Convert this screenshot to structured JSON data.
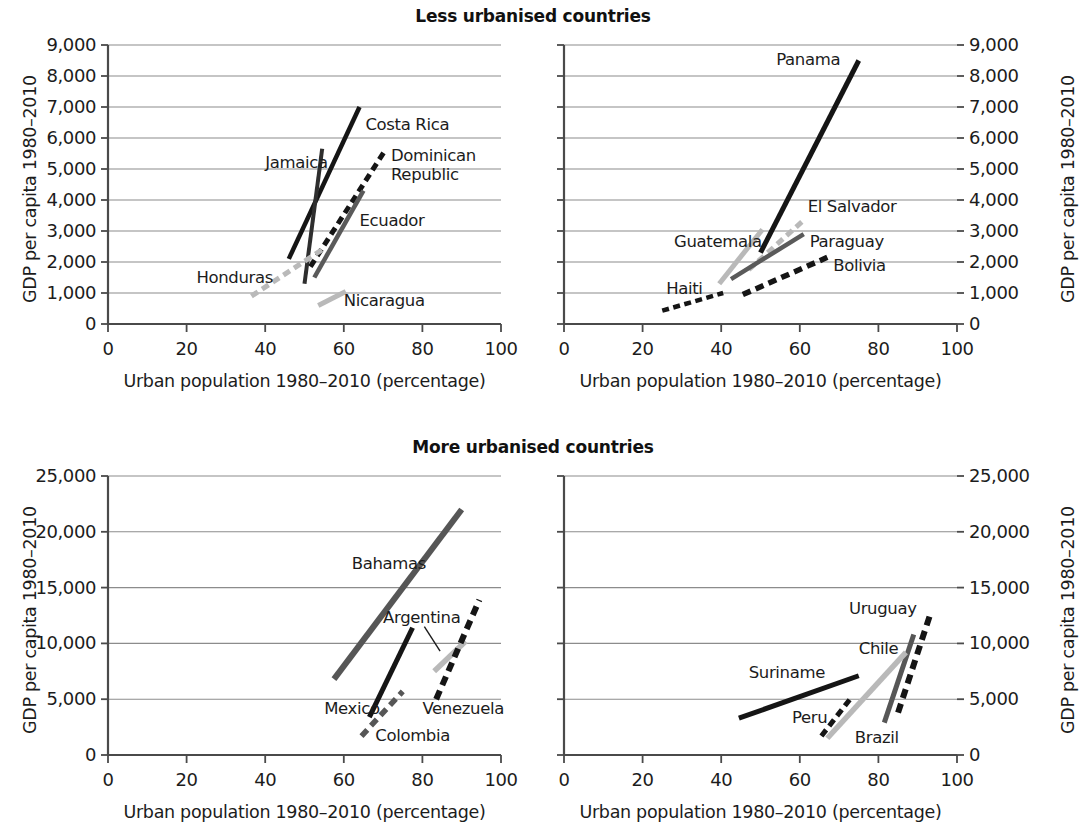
{
  "figure": {
    "width": 1081,
    "height": 827,
    "background": "#ffffff"
  },
  "row_titles": {
    "top": "Less urbanised countries",
    "bottom": "More urbanised countries"
  },
  "axis_labels": {
    "x": "Urban population 1980–2010 (percentage)",
    "y": "GDP per capita 1980–2010"
  },
  "colors": {
    "black": "#151515",
    "dark_gray": "#565656",
    "light_gray": "#b9b9b9",
    "axis": "#4a4a4a",
    "grid": "#8c8c8c",
    "text": "#1c1c1c"
  },
  "chart_data": [
    {
      "id": "panel-top-left",
      "type": "line",
      "title": "Less urbanised countries",
      "xlabel": "Urban population 1980–2010 (percentage)",
      "ylabel": "GDP per capita 1980–2010",
      "xlim": [
        0,
        100
      ],
      "ylim": [
        0,
        9000
      ],
      "xticks": [
        0,
        20,
        40,
        60,
        80,
        100
      ],
      "yticks": [
        0,
        1000,
        2000,
        3000,
        4000,
        5000,
        6000,
        7000,
        8000,
        9000
      ],
      "ytick_labels": [
        "0",
        "1,000",
        "2,000",
        "3,000",
        "4,000",
        "5,000",
        "6,000",
        "7,000",
        "8,000",
        "9,000"
      ],
      "xtick_labels": [
        "0",
        "20",
        "40",
        "60",
        "80",
        "100"
      ],
      "grid": "horizontal",
      "y_axis_side": "left",
      "series": [
        {
          "name": "Costa Rica",
          "style": "solid",
          "color": "#151515",
          "width": 4.5,
          "points": [
            [
              46.0,
              2100
            ],
            [
              64.0,
              7000
            ]
          ],
          "label_x": 65.5,
          "label_y": 6400,
          "label_anchor": "start"
        },
        {
          "name": "Jamaica",
          "style": "solid",
          "color": "#2e2e2e",
          "width": 4.0,
          "points": [
            [
              50.0,
              1300
            ],
            [
              54.5,
              5650
            ]
          ],
          "label_x": 40.0,
          "label_y": 5150,
          "label_anchor": "start"
        },
        {
          "name": "Dominican Republic",
          "style": "dashed",
          "color": "#151515",
          "width": 5.0,
          "points": [
            [
              51.5,
              1850
            ],
            [
              70.5,
              5600
            ]
          ],
          "label_x": 72.0,
          "label_y": 5350,
          "label_anchor": "start"
        },
        {
          "name": "Ecuador",
          "style": "solid",
          "color": "#5a5a5a",
          "width": 4.5,
          "points": [
            [
              52.5,
              1500
            ],
            [
              65.0,
              4300
            ]
          ],
          "label_x": 64.0,
          "label_y": 3300,
          "label_anchor": "start"
        },
        {
          "name": "Honduras",
          "style": "dashed",
          "color": "#b9b9b9",
          "width": 5.0,
          "points": [
            [
              36.5,
              900
            ],
            [
              54.5,
              2400
            ]
          ],
          "label_x": 22.5,
          "label_y": 1450,
          "label_anchor": "start"
        },
        {
          "name": "Nicaragua",
          "style": "solid",
          "color": "#b9b9b9",
          "width": 5.0,
          "points": [
            [
              53.5,
              600
            ],
            [
              60.5,
              1050
            ]
          ],
          "label_x": 60.0,
          "label_y": 700,
          "label_anchor": "start"
        }
      ]
    },
    {
      "id": "panel-top-right",
      "type": "line",
      "title": "Less urbanised countries",
      "xlabel": "Urban population 1980–2010 (percentage)",
      "ylabel": "GDP per capita 1980–2010",
      "xlim": [
        0,
        100
      ],
      "ylim": [
        0,
        9000
      ],
      "xticks": [
        0,
        20,
        40,
        60,
        80,
        100
      ],
      "yticks": [
        0,
        1000,
        2000,
        3000,
        4000,
        5000,
        6000,
        7000,
        8000,
        9000
      ],
      "ytick_labels": [
        "0",
        "1,000",
        "2,000",
        "3,000",
        "4,000",
        "5,000",
        "6,000",
        "7,000",
        "8,000",
        "9,000"
      ],
      "xtick_labels": [
        "0",
        "20",
        "40",
        "60",
        "80",
        "100"
      ],
      "grid": "horizontal",
      "y_axis_side": "right",
      "series": [
        {
          "name": "Panama",
          "style": "solid",
          "color": "#151515",
          "width": 5.0,
          "points": [
            [
              50.0,
              2300
            ],
            [
              75.0,
              8500
            ]
          ],
          "label_x": 54.0,
          "label_y": 8500,
          "label_anchor": "start"
        },
        {
          "name": "El Salvador",
          "style": "dashed",
          "color": "#b9b9b9",
          "width": 5.0,
          "points": [
            [
              47.0,
              1750
            ],
            [
              61.0,
              3350
            ]
          ],
          "label_x": 62.0,
          "label_y": 3750,
          "label_anchor": "start"
        },
        {
          "name": "Guatemala",
          "style": "solid",
          "color": "#b9b9b9",
          "width": 5.0,
          "points": [
            [
              39.5,
              1300
            ],
            [
              50.5,
              3050
            ]
          ],
          "label_x": 28.0,
          "label_y": 2600,
          "label_anchor": "start"
        },
        {
          "name": "Paraguay",
          "style": "solid",
          "color": "#5a5a5a",
          "width": 4.5,
          "points": [
            [
              42.5,
              1450
            ],
            [
              61.0,
              2900
            ]
          ],
          "label_x": 62.5,
          "label_y": 2600,
          "label_anchor": "start"
        },
        {
          "name": "Bolivia",
          "style": "dashed",
          "color": "#151515",
          "width": 5.5,
          "points": [
            [
              45.5,
              950
            ],
            [
              67.0,
              2150
            ]
          ],
          "label_x": 68.5,
          "label_y": 1850,
          "label_anchor": "start"
        },
        {
          "name": "Haiti",
          "style": "dashed",
          "color": "#151515",
          "width": 4.5,
          "points": [
            [
              25.0,
              430
            ],
            [
              40.5,
              1000
            ]
          ],
          "label_x": 26.0,
          "label_y": 1100,
          "label_anchor": "start"
        }
      ]
    },
    {
      "id": "panel-bottom-left",
      "type": "line",
      "title": "More urbanised countries",
      "xlabel": "Urban population 1980–2010 (percentage)",
      "ylabel": "GDP per capita 1980–2010",
      "xlim": [
        0,
        100
      ],
      "ylim": [
        0,
        25000
      ],
      "xticks": [
        0,
        20,
        40,
        60,
        80,
        100
      ],
      "yticks": [
        0,
        5000,
        10000,
        15000,
        20000,
        25000
      ],
      "ytick_labels": [
        "0",
        "5,000",
        "10,000",
        "15,000",
        "20,000",
        "25,000"
      ],
      "xtick_labels": [
        "0",
        "20",
        "40",
        "60",
        "80",
        "100"
      ],
      "grid": "horizontal",
      "y_axis_side": "left",
      "series": [
        {
          "name": "Bahamas",
          "style": "solid",
          "color": "#565656",
          "width": 6.0,
          "points": [
            [
              57.5,
              6800
            ],
            [
              90.0,
              22000
            ]
          ],
          "label_x": 62.0,
          "label_y": 17000,
          "label_anchor": "start"
        },
        {
          "name": "Argentina",
          "style": "solid",
          "color": "#b9b9b9",
          "width": 5.5,
          "points": [
            [
              83.0,
              7500
            ],
            [
              91.0,
              10200
            ]
          ],
          "label_x": 70.0,
          "label_y": 12200,
          "label_anchor": "start",
          "leader": [
            [
              80.5,
              11500
            ],
            [
              84.5,
              9300
            ]
          ]
        },
        {
          "name": "Mexico",
          "style": "solid",
          "color": "#151515",
          "width": 5.0,
          "points": [
            [
              66.5,
              3400
            ],
            [
              77.5,
              11400
            ]
          ],
          "label_x": 55.0,
          "label_y": 4000,
          "label_anchor": "start"
        },
        {
          "name": "Venezuela",
          "style": "dashed",
          "color": "#151515",
          "width": 6.0,
          "points": [
            [
              83.5,
              5000
            ],
            [
              94.5,
              13900
            ]
          ],
          "label_x": 80.0,
          "label_y": 4000,
          "label_anchor": "start"
        },
        {
          "name": "Colombia",
          "style": "dashed",
          "color": "#565656",
          "width": 5.5,
          "points": [
            [
              64.5,
              1700
            ],
            [
              75.0,
              5700
            ]
          ],
          "label_x": 68.0,
          "label_y": 1600,
          "label_anchor": "start"
        }
      ]
    },
    {
      "id": "panel-bottom-right",
      "type": "line",
      "title": "More urbanised countries",
      "xlabel": "Urban population 1980–2010 (percentage)",
      "ylabel": "GDP per capita 1980–2010",
      "xlim": [
        0,
        100
      ],
      "ylim": [
        0,
        25000
      ],
      "xticks": [
        0,
        20,
        40,
        60,
        80,
        100
      ],
      "yticks": [
        0,
        5000,
        10000,
        15000,
        20000,
        25000
      ],
      "ytick_labels": [
        "0",
        "5,000",
        "10,000",
        "15,000",
        "20,000",
        "25,000"
      ],
      "xtick_labels": [
        "0",
        "20",
        "40",
        "60",
        "80",
        "100"
      ],
      "grid": "horizontal",
      "y_axis_side": "right",
      "series": [
        {
          "name": "Uruguay",
          "style": "dashed",
          "color": "#151515",
          "width": 6.0,
          "points": [
            [
              85.0,
              3800
            ],
            [
              93.0,
              12400
            ]
          ],
          "label_x": 72.5,
          "label_y": 13000,
          "label_anchor": "start"
        },
        {
          "name": "Chile",
          "style": "solid",
          "color": "#565656",
          "width": 5.0,
          "points": [
            [
              81.5,
              2900
            ],
            [
              89.0,
              10800
            ]
          ],
          "label_x": 75.0,
          "label_y": 9400,
          "label_anchor": "start"
        },
        {
          "name": "Suriname",
          "style": "solid",
          "color": "#151515",
          "width": 5.0,
          "points": [
            [
              44.5,
              3300
            ],
            [
              75.0,
              7100
            ]
          ],
          "label_x": 47.0,
          "label_y": 7300,
          "label_anchor": "start"
        },
        {
          "name": "Peru",
          "style": "dashed",
          "color": "#151515",
          "width": 5.0,
          "points": [
            [
              65.5,
              1700
            ],
            [
              73.0,
              5100
            ]
          ],
          "label_x": 58.0,
          "label_y": 3200,
          "label_anchor": "start"
        },
        {
          "name": "Brazil",
          "style": "solid",
          "color": "#b9b9b9",
          "width": 5.5,
          "points": [
            [
              67.0,
              1500
            ],
            [
              87.0,
              9200
            ]
          ],
          "label_x": 74.0,
          "label_y": 1400,
          "label_anchor": "start"
        }
      ]
    }
  ]
}
